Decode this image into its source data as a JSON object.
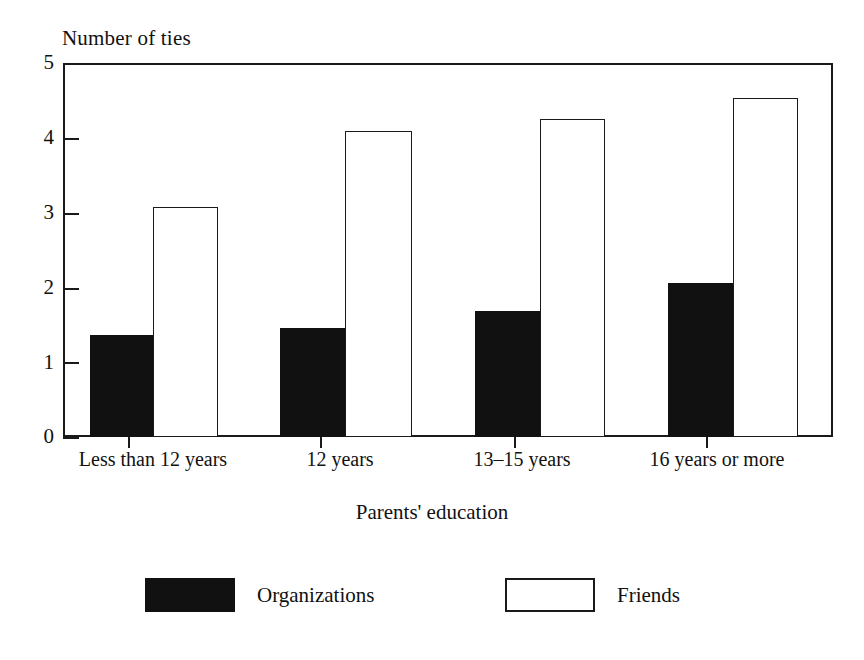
{
  "chart_data": {
    "type": "bar",
    "title": "",
    "ylabel": "Number of ties",
    "xlabel": "Parents' education",
    "categories": [
      "Less than 12 years",
      "12 years",
      "13–15 years",
      "16 years or more"
    ],
    "series": [
      {
        "name": "Organizations",
        "color": "#111111",
        "fill": "solid-black",
        "values": [
          1.36,
          1.46,
          1.68,
          2.06
        ]
      },
      {
        "name": "Friends",
        "color": "#ffffff",
        "fill": "white-outlined",
        "values": [
          3.08,
          4.09,
          4.25,
          4.53
        ]
      }
    ],
    "ylim": [
      0,
      5
    ],
    "yticks": [
      "0",
      "1",
      "2",
      "3",
      "4",
      "5"
    ],
    "ytick_values": [
      0,
      1,
      2,
      3,
      4,
      5
    ],
    "grid": false,
    "legend_position": "bottom",
    "legend": [
      {
        "label": "Organizations",
        "swatch": "filled-black-rect"
      },
      {
        "label": "Friends",
        "swatch": "open-white-rect"
      }
    ],
    "axis_color": "#1a1a1a",
    "background_color": "#ffffff"
  }
}
